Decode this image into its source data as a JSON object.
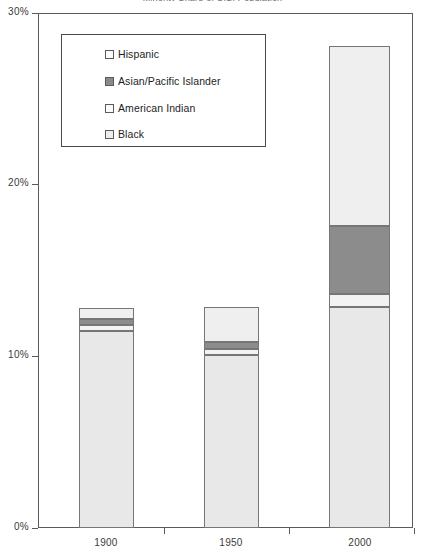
{
  "chart_data": {
    "type": "bar",
    "subtype": "stacked-bar",
    "title": "Minority Share of U.S. Population",
    "categories": [
      "1900",
      "1950",
      "2000"
    ],
    "xlabel": "",
    "ylabel": "",
    "ylim": [
      0,
      30
    ],
    "yticks": [
      0,
      10,
      20,
      30
    ],
    "ytick_labels": [
      "0%",
      "10%",
      "20%",
      "30%"
    ],
    "grid": false,
    "legend_position": "upper-left-inside",
    "value_suffix": "%",
    "stack_order_bottom_up": [
      "Black",
      "American Indian",
      "Asian/Pacific Islander",
      "Hispanic"
    ],
    "series": [
      {
        "name": "Black",
        "color": "#e8e8e8",
        "swatch": "#ededed",
        "values": [
          11.5,
          10.1,
          12.9
        ]
      },
      {
        "name": "American Indian",
        "color": "#f2f2f2",
        "swatch": "#fbfbfb",
        "values": [
          0.35,
          0.3,
          0.75
        ]
      },
      {
        "name": "Asian/Pacific Islander",
        "color": "#8c8c8c",
        "swatch": "#8a8a8a",
        "values": [
          0.3,
          0.45,
          3.95
        ]
      },
      {
        "name": "Hispanic",
        "color": "#efefef",
        "swatch": "#fbfbfb",
        "values": [
          0.65,
          2.05,
          10.5
        ]
      }
    ],
    "totals": [
      12.8,
      12.9,
      28.1
    ]
  },
  "legend": {
    "items": [
      {
        "label": "Hispanic",
        "swatch": "#fbfbfb"
      },
      {
        "label": "Asian/Pacific Islander",
        "swatch": "#8a8a8a"
      },
      {
        "label": "American Indian",
        "swatch": "#fbfbfb"
      },
      {
        "label": "Black",
        "swatch": "#ededed"
      }
    ]
  },
  "axes": {
    "y_labels": [
      "30%",
      "20%",
      "10%",
      "0%"
    ],
    "x_labels": [
      "1900",
      "1950",
      "2000"
    ]
  },
  "colors": {
    "frame": "#5a5a5a",
    "segment_border": "#767676",
    "text": "#3b3b3b",
    "background": "#ffffff"
  }
}
